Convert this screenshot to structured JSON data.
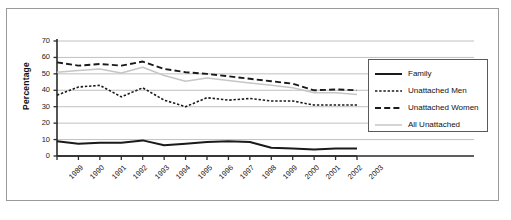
{
  "chart_data": {
    "type": "line",
    "title": "",
    "xlabel": "",
    "ylabel": "Percentage",
    "ylim": [
      0,
      70
    ],
    "ytick_step": 10,
    "grid": true,
    "legend_position": "right",
    "categories": [
      "1989",
      "1990",
      "1991",
      "1992",
      "1993",
      "1994",
      "1995",
      "1996",
      "1997",
      "1998",
      "1999",
      "2000",
      "2001",
      "2002",
      "2003"
    ],
    "yticks": [
      "0",
      "10",
      "20",
      "30",
      "40",
      "50",
      "60",
      "70"
    ],
    "series": [
      {
        "name": "Family",
        "style": "solid",
        "color": "#1a1a1a",
        "width": 2.0,
        "values": [
          9,
          7.5,
          8,
          8,
          9.5,
          6.5,
          7.5,
          8.5,
          9,
          8.5,
          5,
          4.5,
          4,
          4.5,
          4.5
        ]
      },
      {
        "name": "Unattached Men",
        "style": "dotted",
        "color": "#1a1a1a",
        "width": 1.6,
        "values": [
          37,
          42,
          43,
          36,
          41.5,
          34,
          30,
          35.5,
          34,
          35,
          33.5,
          33.5,
          31,
          31,
          31
        ]
      },
      {
        "name": "Unattached Women",
        "style": "dashed",
        "color": "#1a1a1a",
        "width": 1.9,
        "values": [
          57,
          55,
          56,
          55,
          57.5,
          53,
          51,
          50,
          48.5,
          47,
          45.5,
          44,
          40,
          40.5,
          40
        ]
      },
      {
        "name": "All Unattached",
        "style": "solid",
        "color": "#c6c6c6",
        "width": 1.5,
        "values": [
          51,
          52,
          53,
          50.5,
          54,
          49,
          45.5,
          47.5,
          46,
          44.5,
          43,
          41.5,
          38.5,
          38.5,
          37.5
        ]
      }
    ]
  },
  "legend": {
    "items": [
      {
        "label": "Family"
      },
      {
        "label": "Unattached Men"
      },
      {
        "label": "Unattached Women"
      },
      {
        "label": "All Unattached"
      }
    ]
  }
}
